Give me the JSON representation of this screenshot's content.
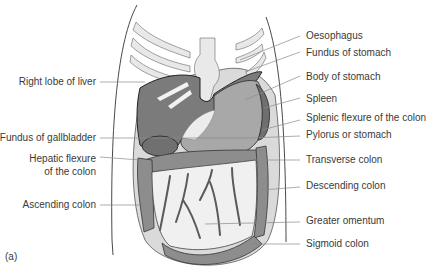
{
  "figure": {
    "panel_label": "(a)",
    "colors": {
      "liver": "#7a7a7a",
      "stomach": "#a9a9a9",
      "spleen": "#6f6f6f",
      "colon": "#8c8c8c",
      "omentum": "#efefef",
      "peritoneum": "#d9d9d9",
      "ribs": "#e6e6e6",
      "vessels": "#6a6a6a"
    },
    "labels_left": [
      {
        "id": "right-lobe-of-liver",
        "text": "Right lobe of liver"
      },
      {
        "id": "fundus-of-gallbladder",
        "text": "Fundus of gallbladder"
      },
      {
        "id": "hepatic-flexure-line1",
        "text": "Hepatic flexure"
      },
      {
        "id": "hepatic-flexure-line2",
        "text": "of the colon"
      },
      {
        "id": "ascending-colon",
        "text": "Ascending colon"
      }
    ],
    "labels_right": [
      {
        "id": "oesophagus",
        "text": "Oesophagus"
      },
      {
        "id": "fundus-of-stomach",
        "text": "Fundus of stomach"
      },
      {
        "id": "body-of-stomach",
        "text": "Body of stomach"
      },
      {
        "id": "spleen",
        "text": "Spleen"
      },
      {
        "id": "splenic-flexure",
        "text": "Splenic flexure of the colon"
      },
      {
        "id": "pylorus",
        "text": "Pylorus or stomach"
      },
      {
        "id": "transverse-colon",
        "text": "Transverse colon"
      },
      {
        "id": "descending-colon",
        "text": "Descending colon"
      },
      {
        "id": "greater-omentum",
        "text": "Greater omentum"
      },
      {
        "id": "sigmoid-colon",
        "text": "Sigmoid colon"
      }
    ]
  }
}
